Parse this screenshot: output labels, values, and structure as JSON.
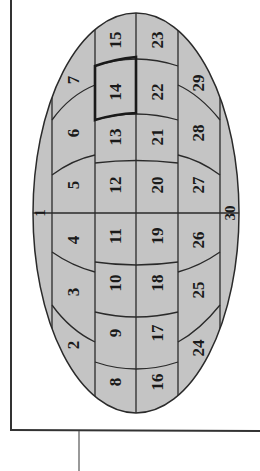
{
  "figure": {
    "type": "segmented-ellipse-diagram",
    "orientation": "rotated -90 degrees",
    "colors": {
      "fill": "#c4c4c4",
      "line": "#2a2a2a",
      "frame": "#333333",
      "background": "#ffffff"
    },
    "highlighted_region": "14",
    "regions": [
      {
        "id": "r1",
        "label": "1",
        "x": 40,
        "y": 213
      },
      {
        "id": "r2",
        "label": "2",
        "x": 73,
        "y": 345
      },
      {
        "id": "r3",
        "label": "3",
        "x": 73,
        "y": 292
      },
      {
        "id": "r4",
        "label": "4",
        "x": 73,
        "y": 240
      },
      {
        "id": "r5",
        "label": "5",
        "x": 73,
        "y": 185
      },
      {
        "id": "r6",
        "label": "6",
        "x": 73,
        "y": 133
      },
      {
        "id": "r7",
        "label": "7",
        "x": 73,
        "y": 80
      },
      {
        "id": "r8",
        "label": "8",
        "x": 115,
        "y": 382
      },
      {
        "id": "r9",
        "label": "9",
        "x": 115,
        "y": 333
      },
      {
        "id": "r10",
        "label": "10",
        "x": 115,
        "y": 283
      },
      {
        "id": "r11",
        "label": "11",
        "x": 115,
        "y": 236
      },
      {
        "id": "r12",
        "label": "12",
        "x": 115,
        "y": 185
      },
      {
        "id": "r13",
        "label": "13",
        "x": 115,
        "y": 137
      },
      {
        "id": "r14",
        "label": "14",
        "x": 115,
        "y": 92
      },
      {
        "id": "r15",
        "label": "15",
        "x": 115,
        "y": 40
      },
      {
        "id": "r16",
        "label": "16",
        "x": 157,
        "y": 382
      },
      {
        "id": "r17",
        "label": "17",
        "x": 157,
        "y": 333
      },
      {
        "id": "r18",
        "label": "18",
        "x": 157,
        "y": 283
      },
      {
        "id": "r19",
        "label": "19",
        "x": 157,
        "y": 236
      },
      {
        "id": "r20",
        "label": "20",
        "x": 157,
        "y": 185
      },
      {
        "id": "r21",
        "label": "21",
        "x": 157,
        "y": 137
      },
      {
        "id": "r22",
        "label": "22",
        "x": 157,
        "y": 92
      },
      {
        "id": "r23",
        "label": "23",
        "x": 157,
        "y": 40
      },
      {
        "id": "r24",
        "label": "24",
        "x": 198,
        "y": 348
      },
      {
        "id": "r25",
        "label": "25",
        "x": 198,
        "y": 290
      },
      {
        "id": "r26",
        "label": "26",
        "x": 198,
        "y": 240
      },
      {
        "id": "r27",
        "label": "27",
        "x": 198,
        "y": 185
      },
      {
        "id": "r28",
        "label": "28",
        "x": 198,
        "y": 133
      },
      {
        "id": "r29",
        "label": "29",
        "x": 198,
        "y": 83
      },
      {
        "id": "r30",
        "label": "30",
        "x": 230,
        "y": 213
      }
    ]
  }
}
